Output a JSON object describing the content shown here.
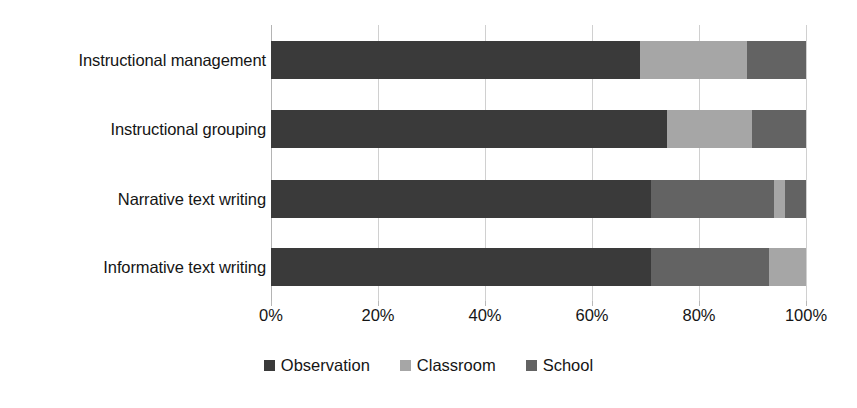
{
  "chart_data": {
    "type": "bar",
    "orientation": "horizontal",
    "stacked": true,
    "stack_mode": "percent",
    "title": "",
    "xlabel": "",
    "ylabel": "",
    "xlim": [
      0,
      100
    ],
    "xtick_labels": [
      "0%",
      "20%",
      "40%",
      "60%",
      "80%",
      "100%"
    ],
    "xtick_values": [
      0,
      20,
      40,
      60,
      80,
      100
    ],
    "grid": "vertical",
    "legend_position": "bottom",
    "categories": [
      "Instructional management",
      "Instructional grouping",
      "Narrative text writing",
      "Informative text writing"
    ],
    "series": [
      {
        "name": "Observation",
        "color": "#3a3a3a",
        "values": [
          69,
          74,
          71,
          71
        ]
      },
      {
        "name": "Classroom",
        "color": "#a6a6a6",
        "values": [
          20,
          16,
          2,
          6
        ]
      },
      {
        "name": "School",
        "color": "#636363",
        "values": [
          11,
          10,
          27,
          23
        ]
      }
    ],
    "bars": [
      {
        "category": "Instructional management",
        "segments": [
          {
            "series": "Observation",
            "value": 69
          },
          {
            "series": "Classroom",
            "value": 20
          },
          {
            "series": "School",
            "value": 11
          }
        ]
      },
      {
        "category": "Instructional grouping",
        "segments": [
          {
            "series": "Observation",
            "value": 74
          },
          {
            "series": "Classroom",
            "value": 16
          },
          {
            "series": "School",
            "value": 10
          }
        ]
      },
      {
        "category": "Narrative text writing",
        "segments": [
          {
            "series": "Observation",
            "value": 71
          },
          {
            "series": "School",
            "value": 23
          },
          {
            "series": "Classroom",
            "value": 2
          },
          {
            "series": "School",
            "value": 4
          }
        ]
      },
      {
        "category": "Informative text writing",
        "segments": [
          {
            "series": "Observation",
            "value": 71
          },
          {
            "series": "School",
            "value": 22
          },
          {
            "series": "Classroom",
            "value": 7
          }
        ]
      }
    ],
    "legend": [
      {
        "label": "Observation",
        "color": "#3a3a3a"
      },
      {
        "label": "Classroom",
        "color": "#a6a6a6"
      },
      {
        "label": "School",
        "color": "#636363"
      }
    ]
  }
}
